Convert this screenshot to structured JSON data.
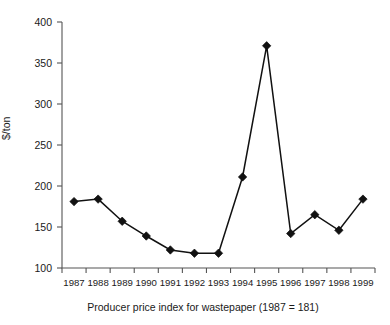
{
  "figure": {
    "caption": "Producer price index for wastepaper (1987 = 181)",
    "y_axis_label": "$/ton",
    "accent_color": "#111111",
    "axis_color": "#555555",
    "background_color": "#ffffff"
  },
  "chart_data": {
    "type": "line",
    "title": "",
    "subtitle": "",
    "xlabel": "",
    "ylabel": "$/ton",
    "caption": "Producer price index for wastepaper (1987 = 181)",
    "categories": [
      "1987",
      "1988",
      "1989",
      "1990",
      "1991",
      "1992",
      "1993",
      "1994",
      "1995",
      "1996",
      "1997",
      "1998",
      "1999"
    ],
    "x": [
      1987,
      1988,
      1989,
      1990,
      1991,
      1992,
      1993,
      1994,
      1995,
      1996,
      1997,
      1998,
      1999
    ],
    "values": [
      181,
      184,
      157,
      139,
      122,
      118,
      118,
      211,
      371,
      142,
      165,
      146,
      184
    ],
    "series": [
      {
        "name": "Producer price index for wastepaper",
        "values": [
          181,
          184,
          157,
          139,
          122,
          118,
          118,
          211,
          371,
          142,
          165,
          146,
          184
        ]
      }
    ],
    "ylim": [
      100,
      400
    ],
    "yticks": [
      100,
      150,
      200,
      250,
      300,
      350,
      400
    ],
    "ytick_labels": [
      "100",
      "150",
      "200",
      "250",
      "300",
      "350",
      "400"
    ],
    "xtick_labels": [
      "1987",
      "1988",
      "1989",
      "1990",
      "1991",
      "1992",
      "1993",
      "1994",
      "1995",
      "1996",
      "1997",
      "1998",
      "1999"
    ],
    "grid": false,
    "legend": false,
    "legend_position": "none",
    "marker": "diamond",
    "line_color": "#111111"
  }
}
